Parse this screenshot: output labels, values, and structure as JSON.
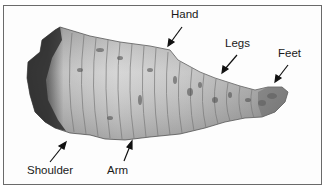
{
  "figure": {
    "labels": [
      {
        "id": "hand",
        "text": "Hand",
        "x": 171,
        "y": 9
      },
      {
        "id": "legs",
        "text": "Legs",
        "x": 225,
        "y": 38
      },
      {
        "id": "feet",
        "text": "Feet",
        "x": 278,
        "y": 48
      },
      {
        "id": "shoulder",
        "text": "Shoulder",
        "x": 27,
        "y": 165
      },
      {
        "id": "arm",
        "text": "Arm",
        "x": 107,
        "y": 165
      }
    ],
    "colors": {
      "frame": "#6a6a6a",
      "text": "#1a1a1a",
      "specimen_light": "#d8d8d8",
      "specimen_dark": "#3a3a3a"
    }
  }
}
